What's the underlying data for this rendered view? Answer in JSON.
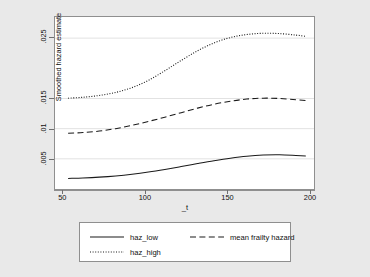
{
  "chart_data": {
    "type": "line",
    "title": "",
    "xlabel": "_t",
    "ylabel": "Smoothed hazard estimate",
    "xlim": [
      45,
      203
    ],
    "ylim": [
      0,
      0.0285
    ],
    "grid": true,
    "grid_axis": "y",
    "legend_position": "bottom",
    "xticks": [
      50,
      100,
      150,
      200
    ],
    "xtick_labels": [
      "50",
      "100",
      "150",
      "200"
    ],
    "yticks": [
      0.005,
      0.01,
      0.015,
      0.025
    ],
    "ytick_labels": [
      ".005",
      ".01",
      ".015",
      ".025"
    ],
    "series": [
      {
        "name": "haz_low",
        "style": "solid",
        "color": "#1a1a1a",
        "x": [
          53,
          62,
          72,
          82,
          92,
          102,
          112,
          122,
          132,
          142,
          152,
          162,
          172,
          182,
          192,
          198
        ],
        "values": [
          0.00175,
          0.00183,
          0.00197,
          0.00217,
          0.00245,
          0.00281,
          0.00324,
          0.00372,
          0.00421,
          0.00468,
          0.0051,
          0.00543,
          0.00562,
          0.00566,
          0.00556,
          0.00548
        ]
      },
      {
        "name": "mean frailty hazard",
        "style": "dashed",
        "color": "#1a1a1a",
        "x": [
          53,
          62,
          72,
          82,
          92,
          102,
          112,
          122,
          132,
          142,
          152,
          162,
          172,
          182,
          192,
          198
        ],
        "values": [
          0.00925,
          0.00935,
          0.0096,
          0.01,
          0.01055,
          0.0112,
          0.0119,
          0.01265,
          0.0134,
          0.01405,
          0.01455,
          0.0149,
          0.01505,
          0.015,
          0.0148,
          0.01465
        ]
      },
      {
        "name": "haz_high",
        "style": "dotted",
        "color": "#1a1a1a",
        "x": [
          53,
          62,
          72,
          82,
          92,
          102,
          112,
          122,
          132,
          142,
          152,
          162,
          172,
          182,
          192,
          198
        ],
        "values": [
          0.01505,
          0.0152,
          0.0155,
          0.016,
          0.0168,
          0.018,
          0.0196,
          0.0213,
          0.0229,
          0.0242,
          0.0251,
          0.0256,
          0.0258,
          0.02575,
          0.0255,
          0.0253
        ]
      }
    ]
  },
  "legend": {
    "entries": [
      {
        "label": "haz_low",
        "style": "solid"
      },
      {
        "label": "mean frailty hazard",
        "style": "dashed"
      },
      {
        "label": "haz_high",
        "style": "dotted"
      }
    ]
  },
  "colors": {
    "background": "#e9e9e9",
    "plot_background": "#ffffff",
    "axis": "#8f8f8f",
    "grid": "#e2e2e2",
    "line": "#1a1a1a",
    "text": "#111111"
  }
}
